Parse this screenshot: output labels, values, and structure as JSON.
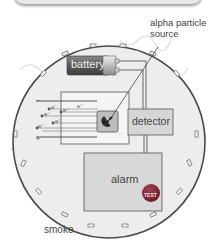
{
  "diagram": {
    "labels": {
      "alpha_source": "alpha particle source",
      "alpha_line1": "alpha particle",
      "alpha_line2": "source",
      "battery": "battery",
      "detector": "detector",
      "alarm": "alarm",
      "test_button": "TEST",
      "smoke": "smoke",
      "electron": "e⁻",
      "plus": "+",
      "minus": "−"
    },
    "icons": [
      "radiation-icon"
    ],
    "colors": {
      "casing": "#eeeeee",
      "casing_border": "#555555",
      "box_fill": "#d9d9d9",
      "battery_dark": "#555555",
      "test_button": "#8a2a3a",
      "smoke_lines": "#dddddd"
    }
  }
}
